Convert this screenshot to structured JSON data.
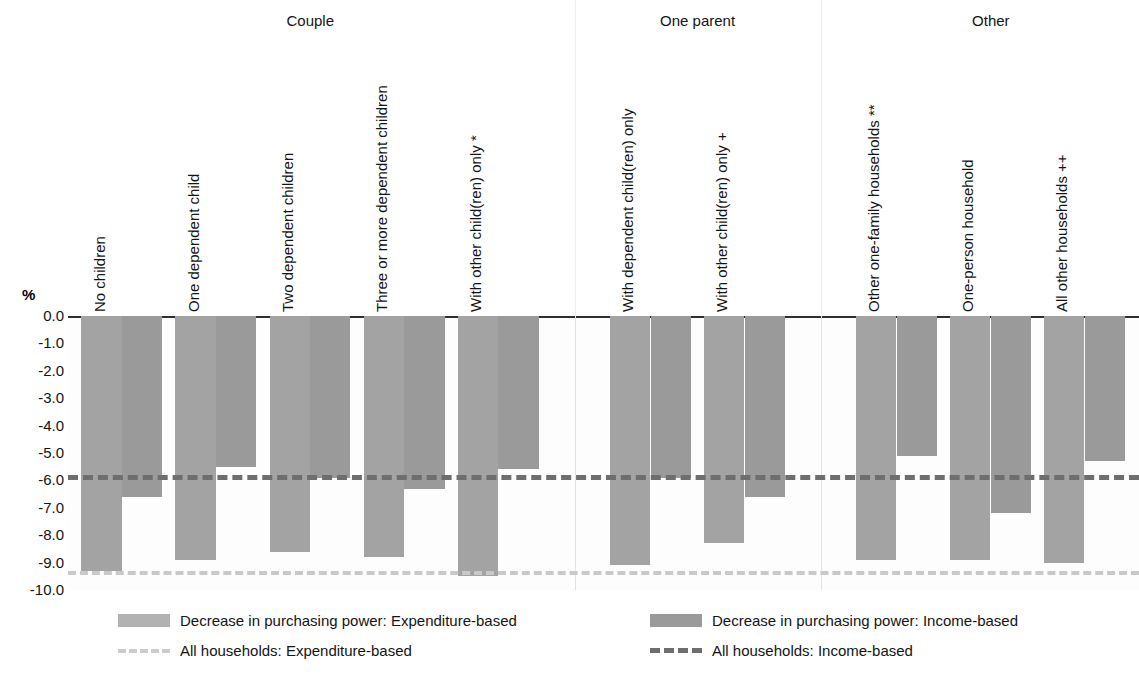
{
  "chart_data": {
    "type": "bar",
    "title": "",
    "xlabel": "",
    "ylabel": "%",
    "ylim": [
      -10.0,
      0.0
    ],
    "ytick_labels": [
      "0.0",
      "-1.0",
      "-2.0",
      "-3.0",
      "-4.0",
      "-5.0",
      "-6.0",
      "-7.0",
      "-8.0",
      "-9.0",
      "-10.0"
    ],
    "ytick_values": [
      0.0,
      -1.0,
      -2.0,
      -3.0,
      -4.0,
      -5.0,
      -6.0,
      -7.0,
      -8.0,
      -9.0,
      -10.0
    ],
    "grid": false,
    "legend_position": "bottom",
    "group_headers": [
      "Couple",
      "One parent",
      "Other"
    ],
    "categories": [
      "No children",
      "One dependent child",
      "Two dependent children",
      "Three or more dependent children",
      "With other child(ren) only *",
      "With dependent child(ren) only",
      "With other child(ren) only +",
      "Other one-family households **",
      "One-person household",
      "All other households ++"
    ],
    "category_groups": [
      "Couple",
      "Couple",
      "Couple",
      "Couple",
      "Couple",
      "One parent",
      "One parent",
      "Other",
      "Other",
      "Other"
    ],
    "series": [
      {
        "name": "Decrease in purchasing power: Expenditure-based",
        "color": "#a3a3a3",
        "values": [
          -9.3,
          -8.9,
          -8.6,
          -8.8,
          -9.5,
          -9.1,
          -8.3,
          -8.9,
          -8.9,
          -9.0
        ]
      },
      {
        "name": "Decrease in purchasing power: Income-based",
        "color": "#9a9a9a",
        "values": [
          -6.6,
          -5.5,
          -5.9,
          -6.3,
          -5.6,
          -5.9,
          -6.6,
          -5.1,
          -7.2,
          -5.3
        ]
      }
    ],
    "reference_lines": [
      {
        "name": "All households: Expenditure-based",
        "value": -9.3,
        "color": "#c9c9c9",
        "style": "dash-dot"
      },
      {
        "name": "All households: Income-based",
        "value": -5.8,
        "color": "#6e6e6e",
        "style": "dashed"
      }
    ]
  },
  "legend": {
    "expenditure_bar": "Decrease in purchasing power: Expenditure-based",
    "income_bar": "Decrease in purchasing power: Income-based",
    "expenditure_line": "All households: Expenditure-based",
    "income_line": "All households: Income-based"
  },
  "axis": {
    "unit": "%"
  }
}
